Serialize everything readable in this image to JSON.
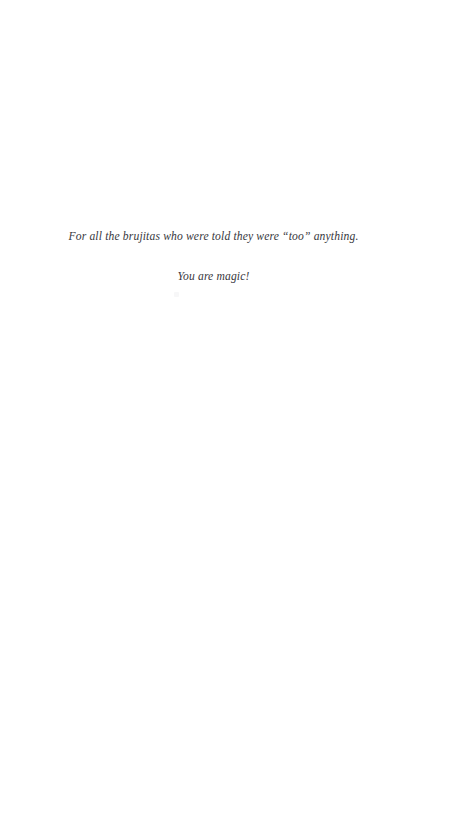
{
  "page": {
    "background_color": "#ffffff",
    "text_color": "#2a2a30",
    "width": 456,
    "height": 813,
    "kind": "book-dedication-page"
  },
  "dedication": {
    "line_1": "For all the brujitas who were told they were “too” anything.",
    "line_2": "You are magic!"
  }
}
